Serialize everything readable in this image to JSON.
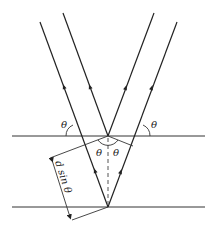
{
  "diagram": {
    "labels": {
      "theta_left": "θ",
      "theta_right": "θ",
      "theta_inner_left": "θ",
      "theta_inner_right": "θ",
      "path_difference": "d sin θ"
    },
    "colors": {
      "line": "#222222",
      "background": "#ffffff"
    },
    "elements": [
      "upper crystal plane",
      "lower crystal plane",
      "incident ray 1 (reflected at upper plane)",
      "incident ray 2 (reflected at lower plane)",
      "reflected ray 1",
      "reflected ray 2",
      "normal (dashed)",
      "perpendicular construction lines",
      "d sin θ dimension arrow"
    ]
  }
}
